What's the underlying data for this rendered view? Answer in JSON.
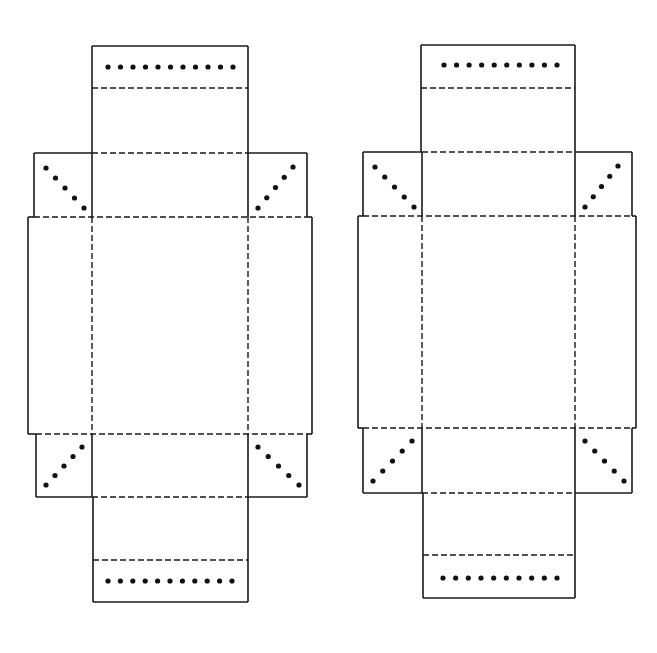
{
  "diagram": {
    "type": "box-net-templates",
    "colors": {
      "line": "#1a1a1a",
      "dot": "#111111",
      "background": "#ffffff"
    },
    "nets": [
      {
        "id": "left",
        "top_panel": {
          "x1": 92,
          "x2": 248,
          "y_top": 46,
          "fold_tab": 88,
          "y_bottom": 153,
          "dots": 11,
          "dot_y": 67,
          "dot_x1": 108,
          "dot_x2": 233
        },
        "top_flaps": {
          "y_top": 153,
          "y_bottom": 217,
          "left_x": 34,
          "right_x": 307
        },
        "side_panel": {
          "x1": 28,
          "x2": 312,
          "y_top": 217,
          "y_bottom": 434
        },
        "inner_x": [
          92,
          248
        ],
        "bottom_flaps": {
          "y_top": 434,
          "y_bottom": 497,
          "left_x": 36,
          "right_x": 307
        },
        "bottom_panel": {
          "x1": 93,
          "x2": 248,
          "y_top": 497,
          "fold_tab": 560,
          "y_bottom": 602,
          "dots": 11,
          "dot_y": 581,
          "dot_x1": 108,
          "dot_x2": 232
        }
      },
      {
        "id": "right",
        "top_panel": {
          "x1": 421,
          "x2": 575,
          "y_top": 45,
          "fold_tab": 88,
          "y_bottom": 152,
          "dots": 10,
          "dot_y": 65,
          "dot_x1": 444,
          "dot_x2": 557
        },
        "top_flaps": {
          "y_top": 152,
          "y_bottom": 216,
          "left_x": 363,
          "right_x": 632
        },
        "side_panel": {
          "x1": 358,
          "x2": 636,
          "y_top": 216,
          "y_bottom": 428
        },
        "inner_x": [
          422,
          575
        ],
        "bottom_flaps": {
          "y_top": 428,
          "y_bottom": 493,
          "left_x": 363,
          "right_x": 632
        },
        "bottom_panel": {
          "x1": 423,
          "x2": 575,
          "y_top": 493,
          "fold_tab": 555,
          "y_bottom": 598,
          "dots": 10,
          "dot_y": 578,
          "dot_x1": 443,
          "dot_x2": 557
        }
      }
    ],
    "corner_flap_dots": 5
  }
}
